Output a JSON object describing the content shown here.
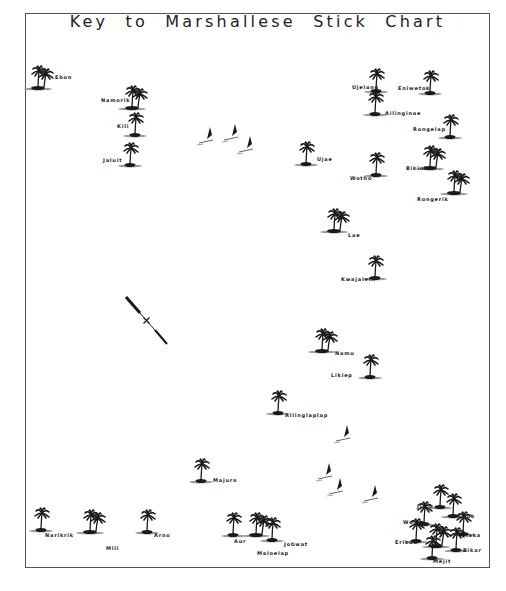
{
  "title": "Key to Marshallese Stick Chart",
  "colors": {
    "ink": "#1a1a1a",
    "frame": "#555555",
    "background": "#ffffff"
  },
  "islands": [
    {
      "name": "Ebon",
      "x": 38,
      "y": 75,
      "trees": 2,
      "lx": 55,
      "ly": 74
    },
    {
      "name": "Namorik",
      "x": 132,
      "y": 95,
      "trees": 2,
      "lx": 101,
      "ly": 97
    },
    {
      "name": "Kili",
      "x": 135,
      "y": 122,
      "trees": 1,
      "lx": 117,
      "ly": 123
    },
    {
      "name": "Jaluit",
      "x": 130,
      "y": 152,
      "trees": 1,
      "lx": 103,
      "ly": 157
    },
    {
      "name": "Ujae",
      "x": 306,
      "y": 151,
      "trees": 1,
      "lx": 317,
      "ly": 156
    },
    {
      "name": "Ujelang",
      "x": 376,
      "y": 78,
      "trees": 1,
      "lx": 352,
      "ly": 84
    },
    {
      "name": "Eniwetok",
      "x": 430,
      "y": 80,
      "trees": 1,
      "lx": 398,
      "ly": 85
    },
    {
      "name": "Ailinginae",
      "x": 375,
      "y": 101,
      "trees": 1,
      "lx": 385,
      "ly": 110
    },
    {
      "name": "Rongelap",
      "x": 450,
      "y": 124,
      "trees": 1,
      "lx": 413,
      "ly": 126
    },
    {
      "name": "Bikini",
      "x": 430,
      "y": 155,
      "trees": 2,
      "lx": 406,
      "ly": 165
    },
    {
      "name": "Wotho",
      "x": 376,
      "y": 162,
      "trees": 1,
      "lx": 350,
      "ly": 175
    },
    {
      "name": "Rongerik",
      "x": 454,
      "y": 180,
      "trees": 2,
      "lx": 417,
      "ly": 196
    },
    {
      "name": "Lae",
      "x": 334,
      "y": 218,
      "trees": 2,
      "lx": 348,
      "ly": 232
    },
    {
      "name": "Kwajalein",
      "x": 375,
      "y": 265,
      "trees": 1,
      "lx": 341,
      "ly": 276
    },
    {
      "name": "Namu",
      "x": 322,
      "y": 338,
      "trees": 2,
      "lx": 335,
      "ly": 350
    },
    {
      "name": "Likiep",
      "x": 370,
      "y": 364,
      "trees": 1,
      "lx": 331,
      "ly": 372
    },
    {
      "name": "Ailinglaplap",
      "x": 278,
      "y": 400,
      "trees": 1,
      "lx": 285,
      "ly": 412
    },
    {
      "name": "Majuro",
      "x": 201,
      "y": 468,
      "trees": 1,
      "lx": 213,
      "ly": 477
    },
    {
      "name": "Namorik-south",
      "x": 41,
      "y": 517,
      "trees": 1,
      "lx": 45,
      "ly": 532
    },
    {
      "name": "Mili",
      "x": 90,
      "y": 519,
      "trees": 2,
      "lx": 106,
      "ly": 545
    },
    {
      "name": "Arno",
      "x": 147,
      "y": 519,
      "trees": 1,
      "lx": 154,
      "ly": 532
    },
    {
      "name": "Aur",
      "x": 233,
      "y": 522,
      "trees": 1,
      "lx": 234,
      "ly": 538
    },
    {
      "name": "Maloelap",
      "x": 256,
      "y": 522,
      "trees": 2,
      "lx": 257,
      "ly": 550
    },
    {
      "name": "Jabwat",
      "x": 272,
      "y": 527,
      "trees": 1,
      "lx": 284,
      "ly": 541
    },
    {
      "name": "Jimo",
      "x": 440,
      "y": 494,
      "trees": 1,
      "lx": 417,
      "ly": 503
    },
    {
      "name": "Ailuk",
      "x": 453,
      "y": 503,
      "trees": 1,
      "lx": 457,
      "ly": 513
    },
    {
      "name": "Wotje",
      "x": 424,
      "y": 511,
      "trees": 1,
      "lx": 403,
      "ly": 519
    },
    {
      "name": "Taka",
      "x": 463,
      "y": 521,
      "trees": 1,
      "lx": 465,
      "ly": 532
    },
    {
      "name": "Erikub",
      "x": 416,
      "y": 528,
      "trees": 1,
      "lx": 395,
      "ly": 539
    },
    {
      "name": "Likiep-east",
      "x": 436,
      "y": 533,
      "trees": 2,
      "lx": 0,
      "ly": 0
    },
    {
      "name": "Bikar",
      "x": 456,
      "y": 537,
      "trees": 1,
      "lx": 463,
      "ly": 547
    },
    {
      "name": "Mejit",
      "x": 432,
      "y": 545,
      "trees": 1,
      "lx": 433,
      "ly": 558
    }
  ],
  "island_labels": {
    "Ebon": "Ebon",
    "Namorik": "Namorik",
    "Kili": "Kili",
    "Jaluit": "Jaluit",
    "Ujae": "Ujae",
    "Ujelang": "Ujelang",
    "Eniwetok": "Eniwetok",
    "Ailinginae": "Ailinginae",
    "Rongelap": "Rongelap",
    "Bikini": "Bikini",
    "Wotho": "Wotho",
    "Rongerik": "Rongerik",
    "Lae": "Lae",
    "Kwajalein": "Kwajalein",
    "Namu": "Namu",
    "Likiep": "Likiep",
    "Ailinglaplap": "Ailinglaplap",
    "Majuro": "Majuro",
    "Namorik-south": "Narikrik",
    "Mili": "Mili",
    "Arno": "Arno",
    "Aur": "Aur",
    "Maloelap": "Maloelap",
    "Jabwat": "Jobwat",
    "Jimo": "Jimo",
    "Ailuk": "Ailuk",
    "Wotje": "Wotje",
    "Taka": "Taka",
    "Erikub": "Erikub",
    "Likiep-east": "",
    "Bikar": "Bikar",
    "Mejit": "Mejit"
  },
  "canoes": [
    {
      "x": 207,
      "y": 139
    },
    {
      "x": 232,
      "y": 136
    },
    {
      "x": 247,
      "y": 148
    },
    {
      "x": 344,
      "y": 437
    },
    {
      "x": 326,
      "y": 475
    },
    {
      "x": 337,
      "y": 490
    },
    {
      "x": 372,
      "y": 497
    }
  ],
  "compass_needle": {
    "x1": 126,
    "y1": 297,
    "x2": 167,
    "y2": 344
  }
}
